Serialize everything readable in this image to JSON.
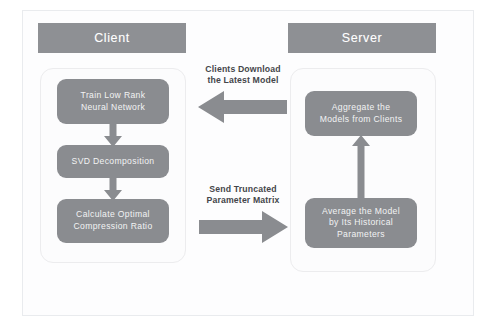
{
  "diagram": {
    "colors": {
      "node_fill": "#8a8c90",
      "header_fill": "#8e9094",
      "node_text": "#f2f3f4",
      "caption_text": "#44464a",
      "panel_fill": "#fcfcfd",
      "panel_border": "#ececee",
      "frame_border": "#e9ebee",
      "arrow_fill": "#8a8c90",
      "background": "#ffffff"
    },
    "columns": {
      "client": {
        "header_label": "Client",
        "nodes": [
          {
            "id": "train",
            "label": "Train Low Rank\nNeural Network"
          },
          {
            "id": "svd",
            "label": "SVD Decomposition"
          },
          {
            "id": "compression",
            "label": "Calculate Optimal\nCompression Ratio"
          }
        ]
      },
      "server": {
        "header_label": "Server",
        "nodes": [
          {
            "id": "aggregate",
            "label": "Aggregate the\nModels from Clients"
          },
          {
            "id": "average",
            "label": "Average the Model\nby Its Historical\nParameters"
          }
        ]
      }
    },
    "transfers": [
      {
        "id": "download",
        "caption": "Clients Download\nthe Latest Model",
        "direction": "left",
        "from": "server",
        "to": "client"
      },
      {
        "id": "upload",
        "caption": "Send Truncated\nParameter Matrix",
        "direction": "right",
        "from": "client",
        "to": "server"
      }
    ],
    "connectors": [
      {
        "id": "train-to-svd",
        "direction": "down",
        "from": "train",
        "to": "svd"
      },
      {
        "id": "svd-to-compression",
        "direction": "down",
        "from": "svd",
        "to": "compression"
      },
      {
        "id": "average-to-aggregate",
        "direction": "up",
        "from": "average",
        "to": "aggregate"
      }
    ]
  }
}
